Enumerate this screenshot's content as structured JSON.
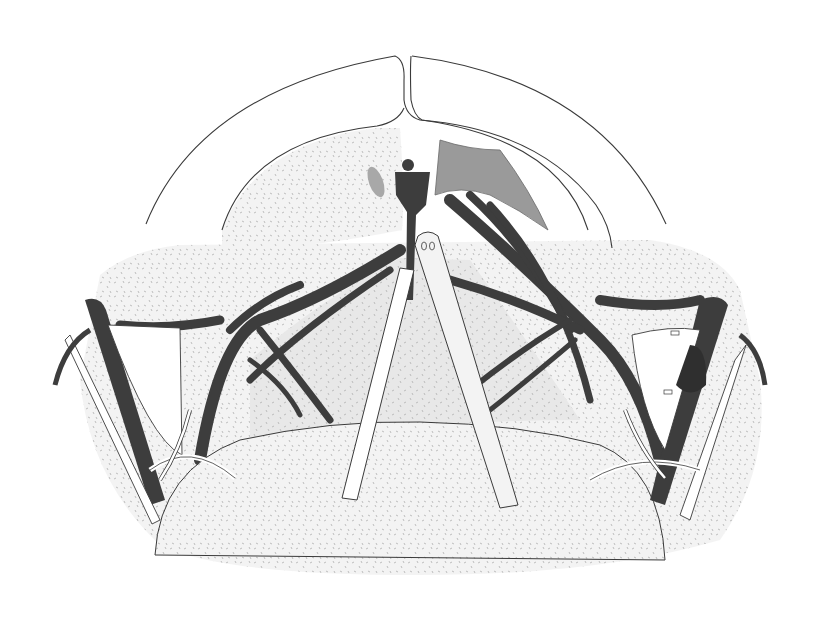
{
  "figure": {
    "type": "surgical-anatomical-illustration",
    "description": "Line illustration of an operative field: outer curved skin/tissue flaps at top, stippled soft tissue, dark vessel/nerve branches radiating bilaterally, two retractors in the center, bilateral clamped structures with looped ties at left and right",
    "labels": []
  },
  "colors": {
    "background": "#ffffff",
    "outline": "#3a3a3a",
    "stipple_fill": "#f1f1f1",
    "stipple_dot": "#b5b5b5",
    "dark_structure": "#3d3d3d",
    "mid_gray_flap": "#9a9a9a",
    "light_gray_region": "#e4e4e4",
    "retractor_fill": "#ffffff"
  },
  "regions": [
    {
      "name": "outer-flap-left"
    },
    {
      "name": "outer-flap-right"
    },
    {
      "name": "inner-stippled-field"
    },
    {
      "name": "central-dark-node"
    },
    {
      "name": "gray-reflected-flap"
    },
    {
      "name": "retractor-left"
    },
    {
      "name": "retractor-right"
    },
    {
      "name": "bilateral-vessel-branches"
    },
    {
      "name": "lower-stippled-mound"
    },
    {
      "name": "left-clamp-with-tie"
    },
    {
      "name": "right-clamp-with-tie"
    }
  ]
}
